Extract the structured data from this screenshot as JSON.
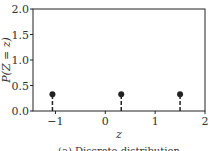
{
  "chart_data": {
    "type": "scatter",
    "subtype": "stem",
    "title": "",
    "caption": "(a) Discrete distribution",
    "xlabel": "z",
    "ylabel": "P(Z = z)",
    "xlim": [
      -1.45,
      2.0
    ],
    "ylim": [
      0.0,
      2.0
    ],
    "xticks": [
      -1,
      0,
      1,
      2
    ],
    "xtick_labels": [
      "−1",
      "0",
      "1",
      "2"
    ],
    "yticks": [
      0.0,
      0.5,
      1.0,
      1.5,
      2.0
    ],
    "ytick_labels": [
      "0.0",
      "0.5",
      "1.0",
      "1.5",
      "2.0"
    ],
    "grid": false,
    "legend": null,
    "series": [
      {
        "name": "P(Z=z)",
        "x": [
          -1.06,
          0.32,
          1.5
        ],
        "y": [
          0.33,
          0.33,
          0.33
        ],
        "color": "#222222",
        "stem_style": "dashed"
      }
    ]
  }
}
